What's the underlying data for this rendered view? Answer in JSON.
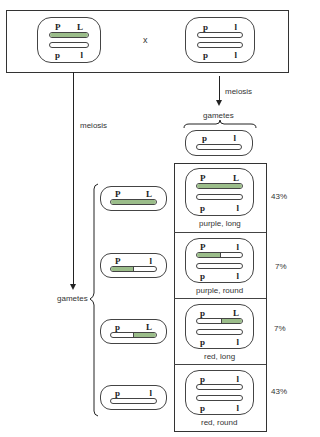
{
  "parents": {
    "cross_symbol": "x",
    "left": {
      "top_alleles": [
        "P",
        "L"
      ],
      "bottom_alleles": [
        "p",
        "l"
      ],
      "top_chromosome": "full-green",
      "bottom_chromosome": "white"
    },
    "right": {
      "top_alleles": [
        "p",
        "l"
      ],
      "bottom_alleles": [
        "p",
        "l"
      ],
      "top_chromosome": "white",
      "bottom_chromosome": "white"
    }
  },
  "left_branch": {
    "process_label": "meiosis",
    "gametes_label": "gametes",
    "gametes": [
      {
        "alleles": [
          "P",
          "L"
        ],
        "chromosome": "full-green"
      },
      {
        "alleles": [
          "P",
          "l"
        ],
        "chromosome": "left-half-green"
      },
      {
        "alleles": [
          "p",
          "L"
        ],
        "chromosome": "right-half-green"
      },
      {
        "alleles": [
          "p",
          "l"
        ],
        "chromosome": "white"
      }
    ]
  },
  "right_branch": {
    "process_label": "meiosis",
    "gametes_label": "gametes",
    "gamete": {
      "alleles": [
        "p",
        "l"
      ],
      "chromosome": "white"
    }
  },
  "offspring": [
    {
      "top_alleles": [
        "P",
        "L"
      ],
      "bottom_alleles": [
        "p",
        "l"
      ],
      "phenotype": "purple, long",
      "percent": "43%"
    },
    {
      "top_alleles": [
        "P",
        "l"
      ],
      "bottom_alleles": [
        "p",
        "l"
      ],
      "phenotype": "purple, round",
      "percent": "7%"
    },
    {
      "top_alleles": [
        "p",
        "L"
      ],
      "bottom_alleles": [
        "p",
        "l"
      ],
      "phenotype": "red, long",
      "percent": "7%"
    },
    {
      "top_alleles": [
        "p",
        "l"
      ],
      "bottom_alleles": [
        "p",
        "l"
      ],
      "phenotype": "red, round",
      "percent": "43%"
    }
  ],
  "colors": {
    "chromosome_green": "#9bbd8a",
    "line": "#222222"
  }
}
